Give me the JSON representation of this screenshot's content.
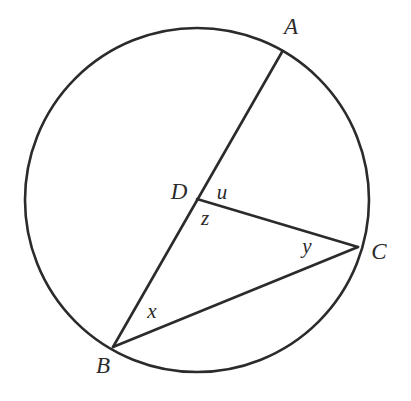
{
  "figure": {
    "background_color": "#ffffff",
    "stroke_color": "#2b2b2b",
    "label_color": "#2b2b2b",
    "circle": {
      "center_x": 197,
      "center_y": 200,
      "radius": 172,
      "stroke_width": 2.6
    },
    "points": [
      {
        "id": "A",
        "label": "A",
        "x": 282,
        "y": 52,
        "label_x": 291,
        "label_y": 29,
        "on_circle": true
      },
      {
        "id": "B",
        "label": "B",
        "x": 113,
        "y": 347,
        "label_x": 103,
        "label_y": 368,
        "on_circle": true
      },
      {
        "id": "C",
        "label": "C",
        "x": 358,
        "y": 247,
        "label_x": 379,
        "label_y": 254,
        "on_circle": true
      },
      {
        "id": "D",
        "label": "D",
        "x": 197,
        "y": 199,
        "label_x": 179,
        "label_y": 194,
        "on_circle": false
      }
    ],
    "segments": [
      {
        "id": "BA",
        "from": "B",
        "to": "A",
        "x1": 113,
        "y1": 347,
        "x2": 282,
        "y2": 52,
        "stroke_width": 2.6
      },
      {
        "id": "BC",
        "from": "B",
        "to": "C",
        "x1": 113,
        "y1": 347,
        "x2": 358,
        "y2": 247,
        "stroke_width": 2.6
      },
      {
        "id": "DC",
        "from": "D",
        "to": "C",
        "x1": 197,
        "y1": 199,
        "x2": 358,
        "y2": 247,
        "stroke_width": 2.6
      }
    ],
    "angle_labels": [
      {
        "id": "u",
        "label": "u",
        "x": 222,
        "y": 194,
        "at_vertex": "D"
      },
      {
        "id": "z",
        "label": "z",
        "x": 205,
        "y": 220,
        "at_vertex": "D"
      },
      {
        "id": "x",
        "label": "x",
        "x": 152,
        "y": 313,
        "at_vertex": "B"
      },
      {
        "id": "y",
        "label": "y",
        "x": 307,
        "y": 248,
        "at_vertex": "C"
      }
    ]
  }
}
